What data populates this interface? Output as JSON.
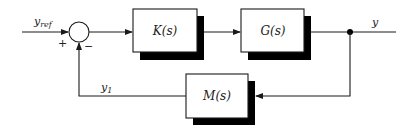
{
  "diagram": {
    "type": "feedback-control-block-diagram",
    "colors": {
      "line": "#1a1a1a",
      "shadow": "#000000",
      "box_fill": "#ffffff",
      "background": "#ffffff"
    },
    "signals": {
      "reference": "y",
      "reference_sub": "ref",
      "output": "y",
      "feedback": "y",
      "feedback_sub": "1"
    },
    "summing_junction": {
      "plus": "+",
      "minus": "−"
    },
    "blocks": [
      {
        "id": "controller",
        "label": "K(s)"
      },
      {
        "id": "plant",
        "label": "G(s)"
      },
      {
        "id": "measurement",
        "label": "M(s)"
      }
    ]
  }
}
